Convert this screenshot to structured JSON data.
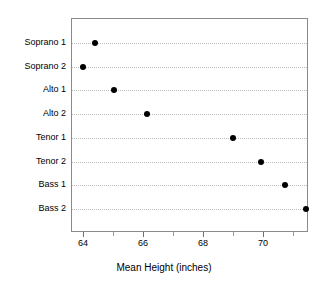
{
  "chart_data": {
    "type": "scatter",
    "title": "",
    "subtitle": "",
    "xlabel": "Mean Height (inches)",
    "ylabel": "",
    "categories": [
      "Soprano 1",
      "Soprano 2",
      "Alto 1",
      "Alto 2",
      "Tenor 1",
      "Tenor 2",
      "Bass 1",
      "Bass 2"
    ],
    "values": [
      64.35,
      63.95,
      65.0,
      66.1,
      68.95,
      69.9,
      70.7,
      71.4
    ],
    "points": [
      {
        "label": "Soprano 1",
        "value": 64.35
      },
      {
        "label": "Soprano 2",
        "value": 63.95
      },
      {
        "label": "Alto 1",
        "value": 65.0
      },
      {
        "label": "Alto 2",
        "value": 66.1
      },
      {
        "label": "Tenor 1",
        "value": 68.95
      },
      {
        "label": "Tenor 2",
        "value": 69.9
      },
      {
        "label": "Bass 1",
        "value": 70.7
      },
      {
        "label": "Bass 2",
        "value": 71.4
      }
    ],
    "xlim": [
      63.6,
      71.5
    ],
    "ylim": [
      0,
      9
    ],
    "x_tick_labels": [
      "64",
      "66",
      "68",
      "70"
    ],
    "x_ticks_major": [
      64,
      66,
      68,
      70
    ],
    "x_ticks_minor": [
      65,
      67,
      69,
      71
    ],
    "grid": "horizontal-dotted",
    "legend": "none",
    "marker": "filled-circle",
    "marker_color": "#000000",
    "grid_color": "#bdbdbd",
    "frame_color": "#8a8a8a",
    "background": "#ffffff"
  }
}
